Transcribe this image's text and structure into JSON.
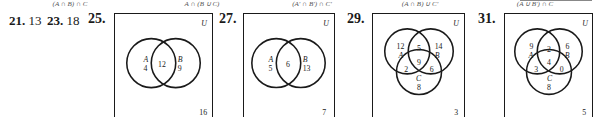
{
  "captions": [
    {
      "text": "(A ∩ B) ∩ C",
      "x": 70
    },
    {
      "text": "A ∩ (B ∪ C)",
      "x": 202
    },
    {
      "text": "(A′ ∩ B′) ∩ C′",
      "x": 312
    },
    {
      "text": "(A ∩ B) ∪ C′",
      "x": 420
    },
    {
      "text": "(A ∪ B′) ∩ C",
      "x": 535
    }
  ],
  "answers": [
    {
      "number": "21.",
      "value": "13"
    },
    {
      "number": "23.",
      "value": "18"
    }
  ],
  "problems": [
    {
      "number": "25.",
      "universe_label": "U",
      "outside": "16",
      "regions": {
        "A_label": "A",
        "A_only": "4",
        "AB": "12",
        "B_label": "B",
        "B_only": "9"
      }
    },
    {
      "number": "27.",
      "universe_label": "U",
      "outside": "7",
      "regions": {
        "A_label": "A",
        "A_only": "5",
        "AB": "6",
        "B_label": "B",
        "B_only": "13"
      }
    },
    {
      "number": "29.",
      "universe_label": "U",
      "outside": "3",
      "regions": {
        "A_label": "A",
        "A_only": "12",
        "AB_only": "5",
        "B_label": "B",
        "B_only": "14",
        "ABC": "9",
        "AC_only": "2",
        "BC_only": "6",
        "C_label": "C",
        "C_only": "8"
      }
    },
    {
      "number": "31.",
      "universe_label": "U",
      "outside": "5",
      "regions": {
        "A_label": "A",
        "A_only": "9",
        "AB_only": "2",
        "B_label": "B",
        "B_only": "6",
        "ABC": "4",
        "AC_only": "3",
        "BC_only": "0",
        "C_label": "C",
        "C_only": "8"
      }
    }
  ]
}
